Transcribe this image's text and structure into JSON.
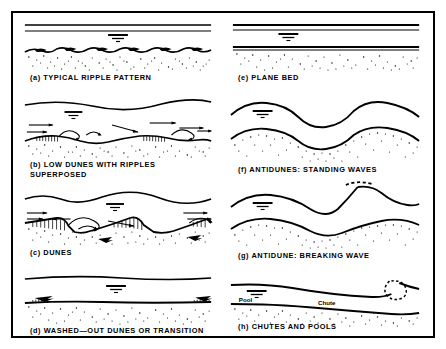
{
  "figure": {
    "background": "#ffffff",
    "ink_color": "#000000",
    "border_color": "#000000",
    "water_surface_symbol": "inverted-triangle-water-level-marker",
    "columns": 2,
    "panel_count": 8
  },
  "panels": [
    {
      "id": "a",
      "column": "left",
      "label": "(a) TYPICAL RIPPLE PATTERN",
      "bedform": "ripples",
      "water_surface": "flat",
      "bed_profile": "small regular ripples",
      "has_flow_arrows": false,
      "has_eddy_arrows": false,
      "has_hatched_lee_faces": true,
      "inline_labels": []
    },
    {
      "id": "b",
      "column": "left",
      "label": "(b) LOW DUNES WITH RIPPLES\nSUPERPOSED",
      "bedform": "low dunes with superposed ripples",
      "water_surface": "gently undulating out of phase",
      "bed_profile": "low dunes with ripples on stoss side",
      "has_flow_arrows": true,
      "has_eddy_arrows": true,
      "has_hatched_lee_faces": true,
      "inline_labels": []
    },
    {
      "id": "c",
      "column": "left",
      "label": "(c) DUNES",
      "bedform": "dunes",
      "water_surface": "undulating out of phase with bed",
      "bed_profile": "large asymmetric dunes",
      "has_flow_arrows": true,
      "has_eddy_arrows": true,
      "has_hatched_lee_faces": true,
      "inline_labels": []
    },
    {
      "id": "d",
      "column": "left",
      "label": "(d) WASHED—OUT DUNES OR TRANSITION",
      "bedform": "washed-out dunes / transition",
      "water_surface": "flat",
      "bed_profile": "nearly plane with low relict dunes",
      "has_flow_arrows": true,
      "has_eddy_arrows": false,
      "has_hatched_lee_faces": true,
      "inline_labels": []
    },
    {
      "id": "e",
      "column": "right",
      "label": "(e) PLANE BED",
      "bedform": "plane bed",
      "water_surface": "flat",
      "bed_profile": "flat",
      "has_flow_arrows": false,
      "has_eddy_arrows": false,
      "has_hatched_lee_faces": false,
      "inline_labels": []
    },
    {
      "id": "f",
      "column": "right",
      "label": "(f) ANTIDUNES: STANDING WAVES",
      "bedform": "antidunes, standing waves",
      "water_surface": "sinusoidal in phase with bed",
      "bed_profile": "sinusoidal symmetric waves",
      "has_flow_arrows": false,
      "has_eddy_arrows": false,
      "has_hatched_lee_faces": false,
      "inline_labels": []
    },
    {
      "id": "g",
      "column": "right",
      "label": "(g) ANTIDUNE: BREAKING WAVE",
      "bedform": "antidune, breaking wave",
      "water_surface": "steep breaking crest shown dashed",
      "bed_profile": "sinusoidal waves in phase",
      "has_flow_arrows": false,
      "has_eddy_arrows": false,
      "has_hatched_lee_faces": false,
      "has_dashed_breaking_crest": true,
      "inline_labels": []
    },
    {
      "id": "h",
      "column": "right",
      "label": "(h) CHUTES AND POOLS",
      "bedform": "chutes and pools",
      "water_surface": "steep drop with hydraulic jump shown dashed",
      "bed_profile": "long chute sloping into pool",
      "has_flow_arrows": false,
      "has_eddy_arrows": false,
      "has_hatched_lee_faces": false,
      "has_dashed_hydraulic_jump": true,
      "inline_labels": [
        "Pool",
        "Chute"
      ]
    }
  ],
  "inline_text": {
    "pool": "Pool",
    "chute": "Chute"
  }
}
